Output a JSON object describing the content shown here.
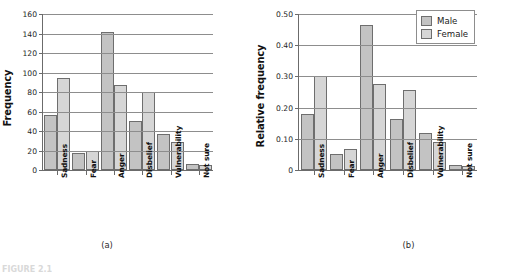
{
  "figure": {
    "caption": "FIGURE 2.1",
    "legend": {
      "male_label": "Male",
      "female_label": "Female",
      "male_color": "#c3c3c3",
      "female_color": "#d6d6d6"
    }
  },
  "chart_data": [
    {
      "type": "bar",
      "panel": "(a)",
      "title": "",
      "xlabel": "",
      "ylabel": "Frequency",
      "ylim": [
        0,
        160
      ],
      "yticks": [
        0,
        20,
        40,
        60,
        80,
        100,
        120,
        140,
        160
      ],
      "ytick_labels": [
        "0",
        "20",
        "40",
        "60",
        "80",
        "100",
        "120",
        "140",
        "160"
      ],
      "grid": true,
      "legend_position": "none",
      "categories": [
        "Sadness",
        "Fear",
        "Anger",
        "Disbelief",
        "Vulnerability",
        "Not sure"
      ],
      "series": [
        {
          "name": "Male",
          "color": "#c3c3c3",
          "values": [
            56,
            17,
            142,
            50,
            37,
            6
          ]
        },
        {
          "name": "Female",
          "color": "#d6d6d6",
          "values": [
            94,
            20,
            87,
            80,
            29,
            5
          ]
        }
      ]
    },
    {
      "type": "bar",
      "panel": "(b)",
      "title": "",
      "xlabel": "",
      "ylabel": "Relative frequency",
      "ylim": [
        0,
        0.5
      ],
      "yticks": [
        0,
        0.1,
        0.2,
        0.3,
        0.4,
        0.5
      ],
      "ytick_labels": [
        "0",
        "0.10",
        "0.20",
        "0.30",
        "0.40",
        "0.50"
      ],
      "grid": true,
      "legend_position": "top-right",
      "categories": [
        "Sadness",
        "Fear",
        "Anger",
        "Disbelief",
        "Vulnerability",
        "Not sure"
      ],
      "series": [
        {
          "name": "Male",
          "color": "#c3c3c3",
          "values": [
            0.18,
            0.05,
            0.465,
            0.165,
            0.118,
            0.016
          ]
        },
        {
          "name": "Female",
          "color": "#d6d6d6",
          "values": [
            0.3,
            0.067,
            0.277,
            0.257,
            0.089,
            0.013
          ]
        }
      ]
    }
  ]
}
